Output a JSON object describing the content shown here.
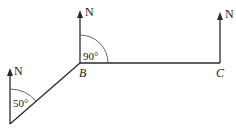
{
  "diagram": {
    "type": "bearing-diagram",
    "north_label": "N",
    "points": {
      "A": {
        "label": ""
      },
      "B": {
        "label": "B"
      },
      "C": {
        "label": "C"
      }
    },
    "angles": {
      "at_A": {
        "label": "50°",
        "value_deg": 50
      },
      "at_B": {
        "label": "90°",
        "value_deg": 90
      }
    },
    "colors": {
      "stroke": "#2a2a2a",
      "text": "#222222"
    }
  }
}
